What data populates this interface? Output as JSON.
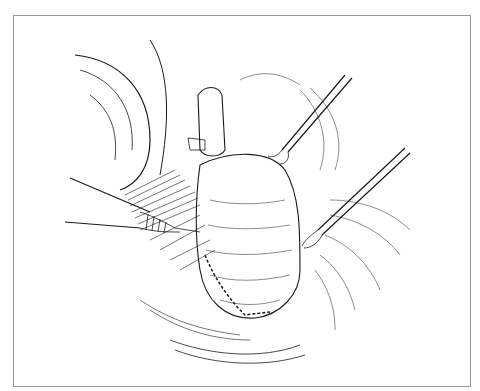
{
  "figure": {
    "type": "surgical line illustration",
    "style": "black ink hatching on white",
    "colors": {
      "ink": "#1a1a1a",
      "paper": "#ffffff",
      "border": "#9a9a9a"
    },
    "elements": [
      "retractor-blade-left",
      "suction-probe-left",
      "organ-central",
      "tubular-structure-top",
      "forceps-upper-right",
      "forceps-lower-right",
      "mesentery-tissue",
      "artist-signature"
    ]
  }
}
